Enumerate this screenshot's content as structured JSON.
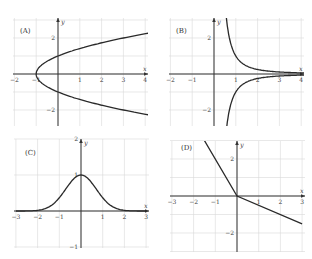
{
  "chart_data": [
    {
      "type": "line",
      "label": "(A)",
      "equation_hint": "y^2 = x + 1",
      "xlabel": "x",
      "ylabel": "y",
      "xlim": [
        -2,
        4
      ],
      "ylim": [
        -3,
        3
      ],
      "x_ticks": [
        "-2",
        "-1",
        "1",
        "2",
        "3",
        "4"
      ],
      "y_ticks": [
        "2",
        "-2"
      ],
      "grid": true,
      "series": [
        {
          "name": "upper",
          "x": [
            -1,
            -0.75,
            0,
            1,
            2,
            3,
            4
          ],
          "y": [
            0,
            0.5,
            1,
            1.41,
            1.73,
            2,
            2.24
          ]
        },
        {
          "name": "lower",
          "x": [
            -1,
            -0.75,
            0,
            1,
            2,
            3,
            4
          ],
          "y": [
            0,
            -0.5,
            -1,
            -1.41,
            -1.73,
            -2,
            -2.24
          ]
        }
      ]
    },
    {
      "type": "line",
      "label": "(B)",
      "equation_hint": "y = ±1/x^2, x > 0",
      "xlabel": "x",
      "ylabel": "y",
      "xlim": [
        -2,
        4
      ],
      "ylim": [
        -3,
        3
      ],
      "x_ticks": [
        "-2",
        "-1",
        "1",
        "2",
        "3",
        "4"
      ],
      "y_ticks": [
        "2",
        "-2"
      ],
      "grid": true,
      "series": [
        {
          "name": "upper",
          "x": [
            0.58,
            0.75,
            1,
            1.5,
            2,
            3,
            4
          ],
          "y": [
            3,
            1.78,
            1,
            0.44,
            0.25,
            0.11,
            0.06
          ]
        },
        {
          "name": "lower",
          "x": [
            0.58,
            0.75,
            1,
            1.5,
            2,
            3,
            4
          ],
          "y": [
            -3,
            -1.78,
            -1,
            -0.44,
            -0.25,
            -0.11,
            -0.06
          ]
        }
      ]
    },
    {
      "type": "line",
      "label": "(C)",
      "equation_hint": "y = e^(-x^2)",
      "xlabel": "x",
      "ylabel": "y",
      "xlim": [
        -3,
        3
      ],
      "ylim": [
        -1,
        2
      ],
      "x_ticks": [
        "-3",
        "-2",
        "-1",
        "1",
        "2",
        "3"
      ],
      "y_ticks": [
        "2",
        "1",
        "-1"
      ],
      "grid": true,
      "series": [
        {
          "name": "curve",
          "x": [
            -3,
            -2,
            -1.5,
            -1,
            -0.5,
            0,
            0.5,
            1,
            1.5,
            2,
            3
          ],
          "y": [
            0,
            0.02,
            0.11,
            0.37,
            0.78,
            1,
            0.78,
            0.37,
            0.11,
            0.02,
            0
          ]
        }
      ]
    },
    {
      "type": "line",
      "label": "(D)",
      "equation_hint": "y = -2x (x<0), y = -x/2 (x>=0)",
      "xlabel": "x",
      "ylabel": "y",
      "xlim": [
        -3,
        3
      ],
      "ylim": [
        -3,
        3
      ],
      "x_ticks": [
        "-3",
        "-2",
        "-1",
        "1",
        "2",
        "3"
      ],
      "y_ticks": [
        "2",
        "-2"
      ],
      "grid": true,
      "series": [
        {
          "name": "piecewise",
          "x": [
            -1.5,
            0,
            3
          ],
          "y": [
            3,
            0,
            -1.5
          ]
        }
      ]
    }
  ]
}
